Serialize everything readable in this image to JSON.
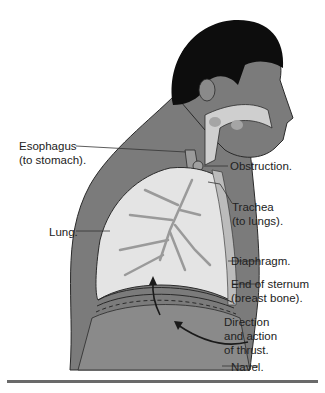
{
  "diagram": {
    "colors": {
      "skin": "#7b7b7b",
      "hair": "#0d0d0d",
      "lung": "#e4e4e4",
      "airway": "#cfcfcf",
      "abdomen": "#8a8a8a",
      "outline": "#2a2a2a",
      "rule": "#6a6a6a"
    },
    "labels": {
      "esophagus": "Esophagus\n(to stomach).",
      "obstruction": "Obstruction.",
      "trachea": "Trachea\n(to lungs).",
      "lung": "Lung.",
      "diaphragm": "Diaphragm.",
      "sternum": "End of sternum\n(breast bone).",
      "thrust": "Direction\nand action\nof thrust.",
      "navel": "Navel."
    }
  }
}
